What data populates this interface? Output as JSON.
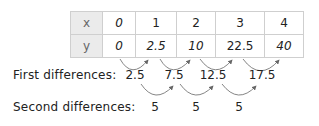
{
  "table": {
    "x_label": "x",
    "y_label": "y",
    "x_values": [
      "0",
      "1",
      "2",
      "3",
      "4"
    ],
    "y_values": [
      "0",
      "2.5",
      "10",
      "22.5",
      "40"
    ]
  },
  "first_differences": {
    "label": "First differences:",
    "values": [
      "2.5",
      "7.5",
      "12.5",
      "17.5"
    ]
  },
  "second_differences": {
    "label": "Second differences:",
    "values": [
      "5",
      "5",
      "5"
    ]
  },
  "colors": {
    "arrow": "#666666",
    "header_bg": "#ebebeb",
    "grid": "#cfcfcf"
  }
}
